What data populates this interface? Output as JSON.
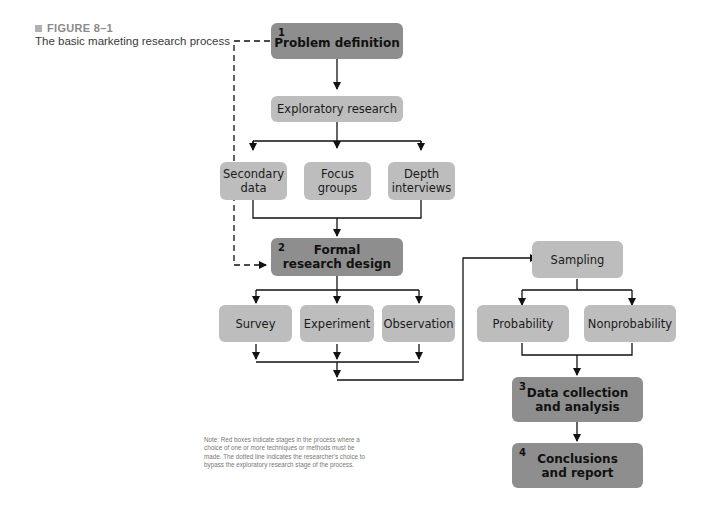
{
  "caption": {
    "figure_label": "FIGURE 8–1",
    "title": "The basic marketing research process"
  },
  "nodes": {
    "problem_definition": {
      "step": "1",
      "label": "Problem definition"
    },
    "exploratory_research": {
      "label": "Exploratory research"
    },
    "secondary_data": {
      "label_line1": "Secondary",
      "label_line2": "data"
    },
    "focus_groups": {
      "label_line1": "Focus",
      "label_line2": "groups"
    },
    "depth_interviews": {
      "label_line1": "Depth",
      "label_line2": "interviews"
    },
    "formal_research_design": {
      "step": "2",
      "label_line1": "Formal",
      "label_line2": "research design"
    },
    "survey": {
      "label": "Survey"
    },
    "experiment": {
      "label": "Experiment"
    },
    "observation": {
      "label": "Observation"
    },
    "sampling": {
      "label": "Sampling"
    },
    "probability": {
      "label": "Probability"
    },
    "nonprobability": {
      "label": "Nonprobability"
    },
    "data_collection": {
      "step": "3",
      "label_line1": "Data collection",
      "label_line2": "and analysis"
    },
    "conclusions": {
      "step": "4",
      "label_line1": "Conclusions",
      "label_line2": "and report"
    }
  },
  "note": "Note: Red boxes indicate stages in the process where a choice of one or more techniques or methods must be made. The dotted line indicates the researcher's choice to bypass the exploratory research stage of the process.",
  "colors": {
    "stage_box": "#8e8e8e",
    "option_box": "#bdbdbd",
    "line": "#111111"
  }
}
